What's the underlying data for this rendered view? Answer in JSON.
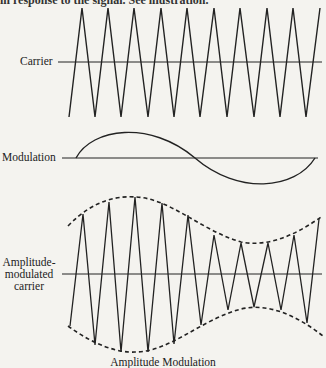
{
  "page": {
    "top_text_fragment": "in response to the signal. See illustration.",
    "caption": "Amplitude Modulation"
  },
  "labels": {
    "carrier": "Carrier",
    "modulation": "Modulation",
    "am_line1": "Amplitude-",
    "am_line2": "modulated",
    "am_line3": "carrier"
  },
  "colors": {
    "background": "#f4f3ef",
    "ink": "#222222"
  },
  "diagram": {
    "carrier": {
      "axis_y": 62,
      "axis_x": [
        58,
        322
      ],
      "points": [
        [
          69,
          117
        ],
        [
          82,
          8
        ],
        [
          95,
          117
        ],
        [
          108,
          8
        ],
        [
          121,
          117
        ],
        [
          134,
          8
        ],
        [
          148,
          117
        ],
        [
          161,
          8
        ],
        [
          174,
          117
        ],
        [
          187,
          8
        ],
        [
          200,
          117
        ],
        [
          214,
          8
        ],
        [
          227,
          117
        ],
        [
          240,
          8
        ],
        [
          254,
          117
        ],
        [
          267,
          8
        ],
        [
          280,
          117
        ],
        [
          293,
          8
        ],
        [
          306,
          117
        ],
        [
          320,
          8
        ]
      ]
    },
    "modulation": {
      "axis_y": 158,
      "axis_x": [
        62,
        318
      ],
      "wave": "sine, one full cycle from x=76 to x=315, amplitude ~23px"
    },
    "am_carrier": {
      "axis_y": 274,
      "axis_x": [
        62,
        322
      ],
      "points": [
        [
          70,
          326
        ],
        [
          83,
          214
        ],
        [
          95,
          345
        ],
        [
          109,
          202
        ],
        [
          121,
          352
        ],
        [
          135,
          197
        ],
        [
          148,
          352
        ],
        [
          162,
          203
        ],
        [
          174,
          344
        ],
        [
          188,
          215
        ],
        [
          201,
          325
        ],
        [
          214,
          235
        ],
        [
          228,
          310
        ],
        [
          241,
          243
        ],
        [
          254,
          307
        ],
        [
          268,
          243
        ],
        [
          281,
          310
        ],
        [
          294,
          235
        ],
        [
          307,
          323
        ],
        [
          319,
          219
        ]
      ],
      "envelope": "dashed upper and lower envelopes following modulation signal"
    }
  }
}
